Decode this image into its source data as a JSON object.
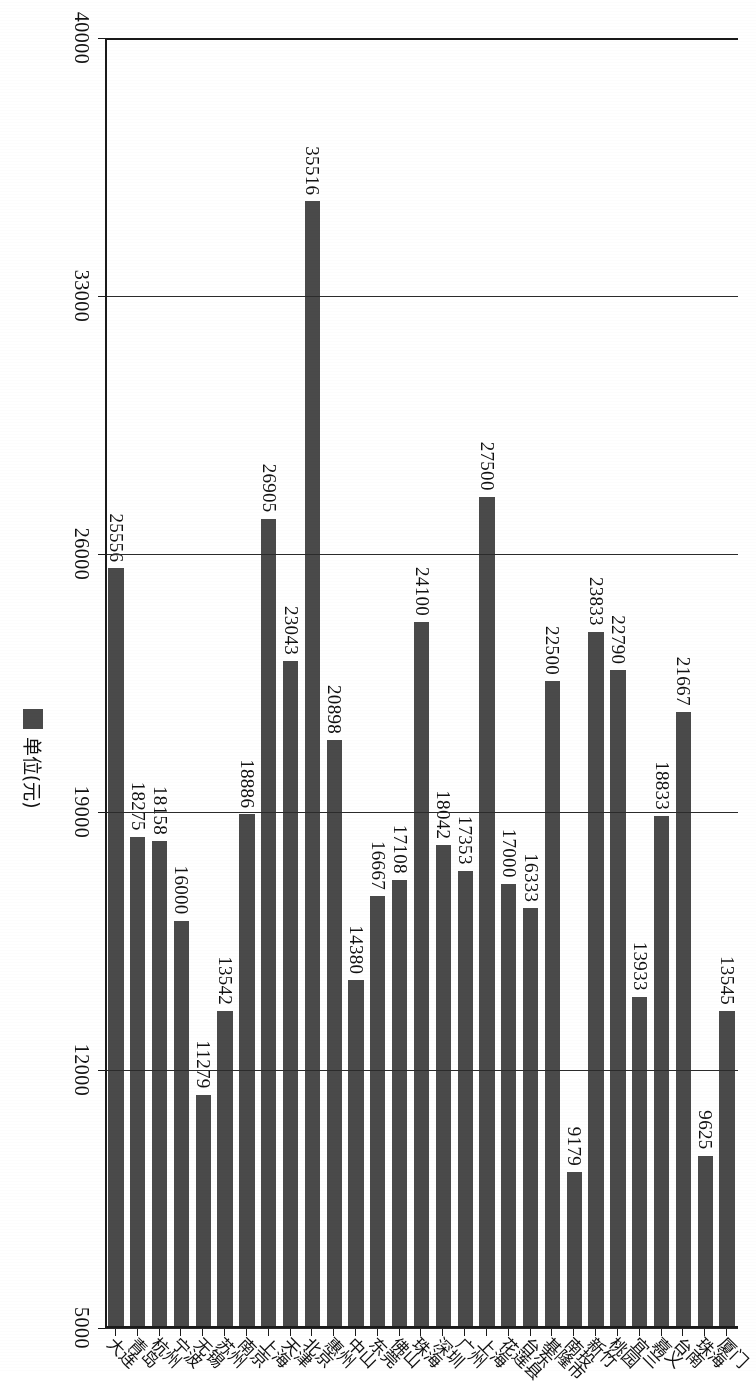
{
  "chart_data": {
    "type": "bar",
    "orientation": "horizontal",
    "title": "",
    "xlabel": "",
    "ylabel": "",
    "legend": [
      {
        "label": "单位(元)",
        "color": "#4a4a4a"
      }
    ],
    "legend_position": "right",
    "grid": true,
    "value_axis": {
      "ticks": [
        "40000",
        "33000",
        "26000",
        "19000",
        "12000",
        "5000"
      ],
      "tick_values": [
        40000,
        33000,
        26000,
        19000,
        12000,
        5000
      ],
      "min": 5000,
      "max": 40000,
      "step": 7000
    },
    "categories": [
      "厦门",
      "珠海",
      "台南",
      "嘉义",
      "宜兰",
      "桃园",
      "新竹",
      "南投",
      "基隆市",
      "台东",
      "花莲县",
      "上海",
      "广州",
      "深圳",
      "珠海",
      "佛山",
      "东莞",
      "中山",
      "惠州",
      "北京",
      "天津",
      "上海",
      "南京",
      "苏州",
      "无锡",
      "宁波",
      "杭州",
      "青岛",
      "大连"
    ],
    "values": [
      13545,
      9625,
      21667,
      18833,
      13933,
      22790,
      23833,
      9179,
      22500,
      16333,
      17000,
      27500,
      17353,
      18042,
      24100,
      17108,
      16667,
      14380,
      20898,
      35516,
      23043,
      26905,
      18886,
      13542,
      11279,
      16000,
      18158,
      18275,
      25556
    ],
    "value_labels": [
      "13545",
      "9625",
      "21667",
      "18833",
      "13933",
      "22790",
      "23833",
      "9179",
      "22500",
      "16333",
      "17000",
      "27500",
      "17353",
      "18042",
      "24100",
      "17108",
      "16667",
      "14380",
      "20898",
      "35516",
      "23043",
      "26905",
      "18886",
      "13542",
      "11279",
      "16000",
      "18158",
      "18275",
      "25556"
    ],
    "bar_color": "#4a4a4a",
    "background": "#ffffff"
  }
}
